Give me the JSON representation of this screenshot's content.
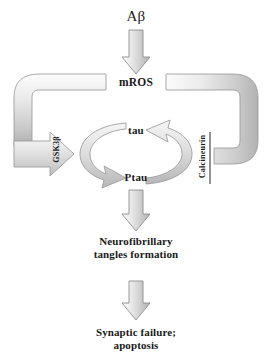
{
  "figure": {
    "type": "biological-signaling-pathway-diagram",
    "background_color": "#ffffff",
    "text_color": "#1a1a1a",
    "arrow_fill_top": "#f2f2f2",
    "arrow_fill_bottom": "#b8b8b8",
    "arrow_stroke": "#8a8a8a",
    "band_stroke": "#9a9a9a"
  },
  "nodes": {
    "amyloid_beta": "Aβ",
    "mros": "mROS",
    "tau": "tau",
    "ptau": "Ptau",
    "gsk3b": "GSK3β",
    "calcineurin": "Calcineurin",
    "tangles_line1": "Neurofibrillary",
    "tangles_line2": "tangles formation",
    "outcome_line1": "Synaptic failure;",
    "outcome_line2": "apoptosis"
  },
  "edges": [
    {
      "id": "ab-to-mros",
      "from": "Aβ",
      "to": "mROS",
      "kind": "activation-arrow",
      "direction": "down"
    },
    {
      "id": "mros-to-gsk3b",
      "from": "mROS",
      "to": "GSK3β",
      "kind": "activation-band-arrow",
      "direction": "left-down-right"
    },
    {
      "id": "mros-to-calcineurin",
      "from": "mROS",
      "to": "Calcineurin",
      "kind": "inhibition-band-bar",
      "direction": "right-down-left"
    },
    {
      "id": "tau-to-ptau",
      "from": "tau",
      "to": "Ptau",
      "kind": "cycle-arc-arrow",
      "direction": "counterclockwise-left"
    },
    {
      "id": "ptau-to-tau",
      "from": "Ptau",
      "to": "tau",
      "kind": "cycle-arc-arrow",
      "direction": "counterclockwise-right"
    },
    {
      "id": "ptau-to-tangles",
      "from": "Ptau",
      "to": "Neurofibrillary tangles formation",
      "kind": "activation-arrow",
      "direction": "down"
    },
    {
      "id": "tangles-to-outcome",
      "from": "Neurofibrillary tangles formation",
      "to": "Synaptic failure; apoptosis",
      "kind": "activation-arrow",
      "direction": "down"
    }
  ]
}
